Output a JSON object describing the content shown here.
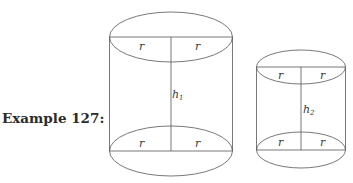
{
  "example_label": "Example 127:",
  "cylinder_large": {
    "top_radius_left": "r",
    "top_radius_right": "r",
    "height_label": "h",
    "height_subscript": "1",
    "bottom_radius_left": "r",
    "bottom_radius_right": "r"
  },
  "cylinder_small": {
    "top_radius_left": "r",
    "top_radius_right": "r",
    "height_label": "h",
    "height_subscript": "2",
    "bottom_radius_left": "r",
    "bottom_radius_right": "r"
  },
  "colors": {
    "stroke": "#555555",
    "text": "#2b2b2b"
  }
}
